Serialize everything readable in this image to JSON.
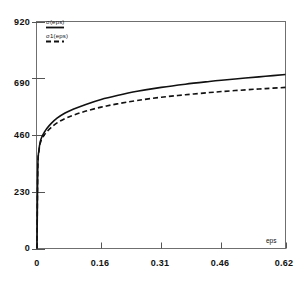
{
  "chart_data": {
    "type": "line",
    "title": "",
    "subtitle": "",
    "xlabel": "eps",
    "ylabel": "",
    "xlim": [
      0,
      0.62
    ],
    "ylim": [
      0,
      920
    ],
    "xticks": [
      "0",
      "0.16",
      "0.31",
      "0.46",
      "0.62"
    ],
    "xtick_values": [
      0,
      0.16,
      0.31,
      0.46,
      0.62
    ],
    "yticks": [
      "0",
      "230",
      "460",
      "690",
      "920"
    ],
    "ytick_values": [
      0,
      230,
      460,
      690,
      920
    ],
    "grid": false,
    "legend_position": "top-left",
    "series": [
      {
        "name": "σ(eps)",
        "style": "solid",
        "color": "#111111",
        "x": [
          0,
          0.002,
          0.005,
          0.008,
          0.012,
          0.018,
          0.025,
          0.035,
          0.05,
          0.07,
          0.09,
          0.12,
          0.16,
          0.2,
          0.25,
          0.31,
          0.37,
          0.43,
          0.46,
          0.52,
          0.57,
          0.62
        ],
        "y": [
          0,
          330,
          400,
          432,
          452,
          470,
          487,
          506,
          528,
          549,
          564,
          583,
          604,
          620,
          637,
          653,
          666,
          677,
          682,
          691,
          698,
          705
        ]
      },
      {
        "name": "σ1(eps)",
        "style": "dashed",
        "color": "#111111",
        "x": [
          0,
          0.002,
          0.005,
          0.008,
          0.012,
          0.018,
          0.025,
          0.035,
          0.05,
          0.07,
          0.09,
          0.12,
          0.16,
          0.2,
          0.25,
          0.31,
          0.37,
          0.43,
          0.46,
          0.52,
          0.57,
          0.62
        ],
        "y": [
          0,
          328,
          396,
          426,
          444,
          460,
          474,
          490,
          509,
          527,
          540,
          556,
          573,
          586,
          600,
          613,
          623,
          632,
          636,
          643,
          648,
          653
        ]
      }
    ]
  },
  "legend": {
    "entries": [
      {
        "label": "σ(eps)",
        "style": "solid"
      },
      {
        "label": "σ1(eps)",
        "style": "dashed"
      }
    ]
  },
  "axes": {
    "x_name": "eps",
    "y_tick_labels": [
      "920",
      "690",
      "460",
      "230",
      "0"
    ],
    "x_tick_labels": [
      "0",
      "0.16",
      "0.31",
      "0.46",
      "0.62"
    ]
  }
}
